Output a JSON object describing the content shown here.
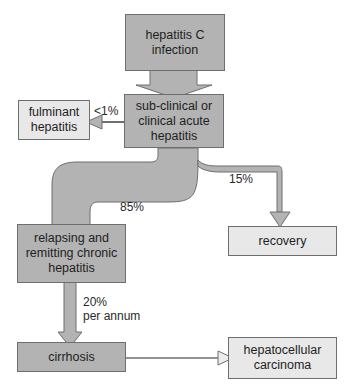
{
  "diagram": {
    "nodes": {
      "infection": "hepatitis C infection",
      "acute": "sub-clinical or clinical acute hepatitis",
      "fulminant": "fulminant hepatitis",
      "chronic": "relapsing and remitting chronic hepatitis",
      "recovery": "recovery",
      "cirrhosis": "cirrhosis",
      "hcc": "hepatocellular carcinoma"
    },
    "edges": {
      "to_fulminant": "<1%",
      "to_recovery": "15%",
      "to_chronic": "85%",
      "to_cirrhosis_line1": "20%",
      "to_cirrhosis_line2": "per annum"
    },
    "colors": {
      "dark_fill": "#b3b3b3",
      "light_fill": "#e8e8e8",
      "border": "#6e6e6e"
    }
  }
}
